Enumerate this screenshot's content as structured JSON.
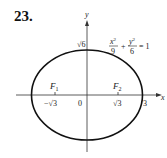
{
  "problem": {
    "number": "23."
  },
  "figure": {
    "type": "ellipse",
    "equation": {
      "x_num": "x",
      "x_exp": "2",
      "x_den": "9",
      "plus": "+",
      "y_num": "y",
      "y_exp": "2",
      "y_den": "6",
      "rhs": "= 1"
    },
    "axes": {
      "x_label": "x",
      "y_label": "y"
    },
    "labels": {
      "origin": "0",
      "y_intercept": "√6",
      "x_intercept": "3",
      "focus1": "F",
      "focus1_sub": "1",
      "focus2": "F",
      "focus2_sub": "2",
      "neg_sqrt3": "−√3",
      "pos_sqrt3": "√3"
    },
    "colors": {
      "stroke": "#111111",
      "axis": "#333333"
    }
  }
}
